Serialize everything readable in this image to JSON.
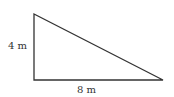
{
  "diagram": {
    "shape": "right triangle",
    "labels": {
      "height": "4 m",
      "base": "8 m"
    },
    "colors": {
      "stroke": "#333333",
      "text": "#333333"
    }
  }
}
